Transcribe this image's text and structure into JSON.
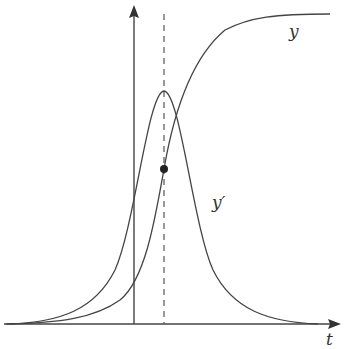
{
  "diagram": {
    "type": "logistic-growth",
    "labels": {
      "curve_y": "y",
      "curve_y_prime": "y′",
      "axis_t": "t"
    },
    "colors": {
      "stroke": "#444444",
      "background": "#ffffff"
    },
    "elements": {
      "x_axis": {
        "y": 324,
        "x_start": 4,
        "x_end": 340
      },
      "y_axis": {
        "x": 134,
        "y_start": 324,
        "y_end": 6
      },
      "inflection_line": {
        "x": 164,
        "style": "dashed"
      },
      "y_prime_peak": {
        "x": 164,
        "y": 91
      },
      "inflection_point": {
        "x": 164,
        "y": 169
      }
    }
  }
}
